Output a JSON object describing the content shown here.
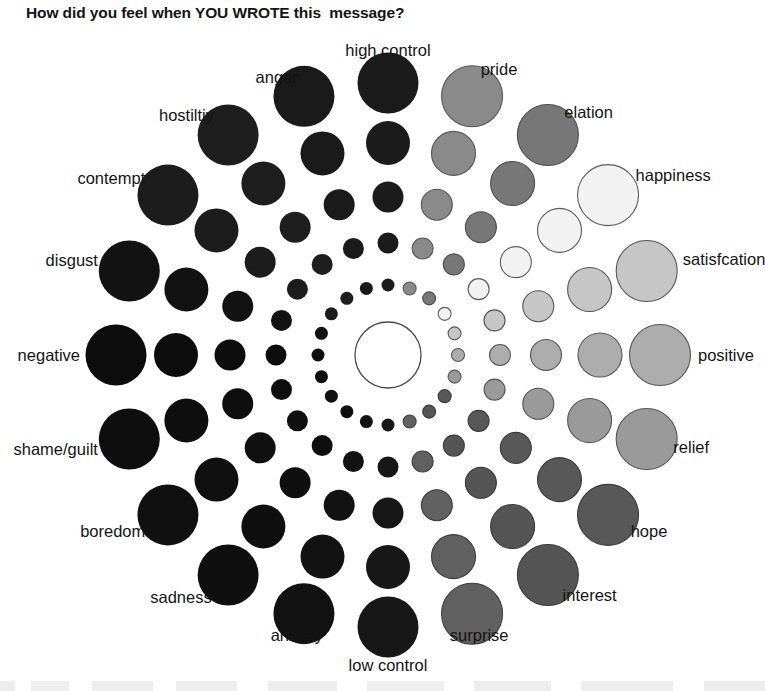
{
  "title": "How did you feel when YOU WROTE this  message?",
  "chart_data": {
    "type": "scatter",
    "title": "How did you feel when YOU WROTE this  message?",
    "subtype": "geneva-emotion-wheel",
    "center": {
      "cx": 388,
      "cy": 355,
      "r": 33,
      "fill": "#ffffff",
      "stroke": "#4a4a4a"
    },
    "rings": 5,
    "ring_radii": [
      6.5,
      10.5,
      15.5,
      22.0,
      30.5
    ],
    "ring_distances": [
      70,
      112,
      158,
      212,
      272
    ],
    "axis_labels": [
      "high control",
      "low control",
      "negative",
      "positive"
    ],
    "legend": "circle size = intensity of the felt emotion",
    "spokes": [
      {
        "label": "high control",
        "angle": -90,
        "color": "#1b1b1b",
        "stroke": "none",
        "label_r": 305,
        "anchor": "middle"
      },
      {
        "label": "pride",
        "angle": -72,
        "color": "#8a8a8a",
        "stroke": "#555555",
        "label_r": 300,
        "anchor": "start"
      },
      {
        "label": "elation",
        "angle": -54,
        "color": "#777777",
        "stroke": "#4d4d4d",
        "label_r": 300,
        "anchor": "start"
      },
      {
        "label": "happiness",
        "angle": -36,
        "color": "#f2f2f2",
        "stroke": "#5a5a5a",
        "label_r": 306,
        "anchor": "start"
      },
      {
        "label": "satisfcation",
        "angle": -18,
        "color": "#c6c6c6",
        "stroke": "#555555",
        "label_r": 310,
        "anchor": "start"
      },
      {
        "label": "positive",
        "angle": 0,
        "color": "#adadad",
        "stroke": "#555555",
        "label_r": 310,
        "anchor": "start"
      },
      {
        "label": "relief",
        "angle": 18,
        "color": "#9a9a9a",
        "stroke": "#555555",
        "label_r": 300,
        "anchor": "start"
      },
      {
        "label": "hope",
        "angle": 36,
        "color": "#585858",
        "stroke": "#3a3a3a",
        "label_r": 300,
        "anchor": "start"
      },
      {
        "label": "interest",
        "angle": 54,
        "color": "#555555",
        "stroke": "#383838",
        "label_r": 297,
        "anchor": "start"
      },
      {
        "label": "surprise",
        "angle": 72,
        "color": "#616161",
        "stroke": "#3d3d3d",
        "label_r": 295,
        "anchor": "middle"
      },
      {
        "label": "low control",
        "angle": 90,
        "color": "#171717",
        "stroke": "none",
        "label_r": 310,
        "anchor": "middle"
      },
      {
        "label": "anxiety",
        "angle": 108,
        "color": "#121212",
        "stroke": "none",
        "label_r": 295,
        "anchor": "middle"
      },
      {
        "label": "sadness",
        "angle": 126,
        "color": "#0f0f0f",
        "stroke": "none",
        "label_r": 300,
        "anchor": "end"
      },
      {
        "label": "boredom",
        "angle": 144,
        "color": "#101010",
        "stroke": "none",
        "label_r": 300,
        "anchor": "end"
      },
      {
        "label": "shame/guilt",
        "angle": 162,
        "color": "#0e0e0e",
        "stroke": "none",
        "label_r": 305,
        "anchor": "end"
      },
      {
        "label": "negative",
        "angle": 180,
        "color": "#0d0d0d",
        "stroke": "none",
        "label_r": 308,
        "anchor": "end"
      },
      {
        "label": "disgust",
        "angle": -162,
        "color": "#121212",
        "stroke": "none",
        "label_r": 305,
        "anchor": "end"
      },
      {
        "label": "contempt",
        "angle": -144,
        "color": "#1c1c1c",
        "stroke": "none",
        "label_r": 300,
        "anchor": "end"
      },
      {
        "label": "hostiltiy",
        "angle": -126,
        "color": "#1e1e1e",
        "stroke": "none",
        "label_r": 296,
        "anchor": "end"
      },
      {
        "label": "anger",
        "angle": -108,
        "color": "#1a1a1a",
        "stroke": "none",
        "label_r": 292,
        "anchor": "end"
      }
    ]
  }
}
